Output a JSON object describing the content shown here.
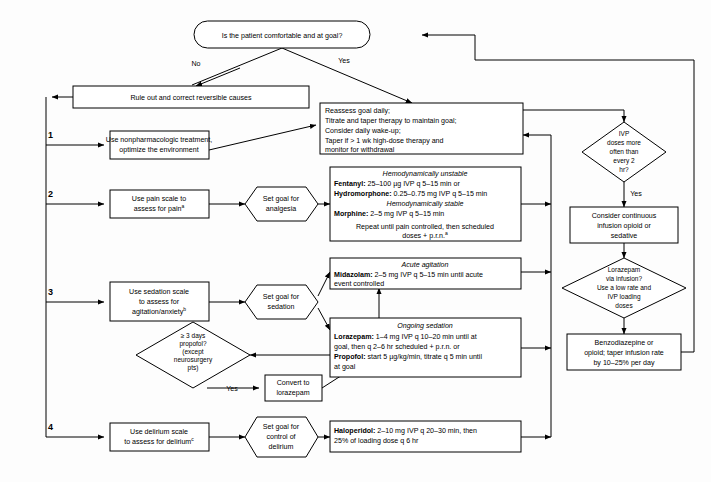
{
  "diagram": {
    "colors": {
      "line": "#000000",
      "box_fill": "#ffffff",
      "page_bg": "#fdfdfd"
    }
  },
  "nodes": {
    "start": {
      "text": "Is the patient comfortable and at goal?",
      "shape": "rounded"
    },
    "rule_out": {
      "text": "Rule out and correct reversible causes",
      "shape": "rect"
    },
    "reassess": {
      "shape": "rect",
      "lines": [
        "Reassess goal daily;",
        "Titrate and taper therapy to maintain goal;",
        "Consider daily wake-up;",
        "Taper if > 1 wk high-dose therapy and",
        "monitor for withdrawal"
      ]
    },
    "step1": {
      "number": "1",
      "shape": "rect",
      "lines": [
        "Use nonpharmacologic treatment,",
        "optimize the environment"
      ]
    },
    "step2": {
      "number": "2",
      "shape": "rect",
      "lines": [
        "Use pain scale to",
        "assess for pain"
      ],
      "superscript": "a"
    },
    "goal_analgesia": {
      "shape": "hexagon",
      "lines": [
        "Set goal for",
        "analgesia"
      ]
    },
    "analgesia_box": {
      "shape": "rect",
      "rows": [
        {
          "style": "italic-center",
          "text": "Hemodynamically unstable"
        },
        {
          "style": "mixed",
          "bold": "Fentanyl:",
          "rest": " 25–100 µg IVP q 5–15 min or"
        },
        {
          "style": "mixed",
          "bold": "Hydromorphone:",
          "rest": " 0.25–0.75 mg IVP q 5–15 min"
        },
        {
          "style": "italic-center",
          "text": "Hemodynamically stable"
        },
        {
          "style": "mixed",
          "bold": "Morphine:",
          "rest": " 2–5 mg IVP q 5–15 min"
        },
        {
          "style": "blank",
          "text": ""
        },
        {
          "style": "center",
          "text": "Repeat until pain controlled, then scheduled"
        },
        {
          "style": "center",
          "text": "doses + p.r.n.",
          "superscript": "a"
        }
      ]
    },
    "step3": {
      "number": "3",
      "shape": "rect",
      "lines": [
        "Use sedation scale",
        "to assess for",
        "agitation/anxiety"
      ],
      "superscript": "b"
    },
    "goal_sedation": {
      "shape": "hexagon",
      "lines": [
        "Set goal for",
        "sedation"
      ]
    },
    "acute_agitation": {
      "shape": "rect",
      "rows": [
        {
          "style": "italic-center",
          "text": "Acute agitation"
        },
        {
          "style": "mixed",
          "bold": "Midazolam:",
          "rest": " 2–5 mg IVP q 5–15 min until acute"
        },
        {
          "style": "plain",
          "text": "event controlled"
        }
      ]
    },
    "ongoing_sedation": {
      "shape": "rect",
      "rows": [
        {
          "style": "italic-center",
          "text": "Ongoing sedation"
        },
        {
          "style": "mixed",
          "bold": "Lorazepam:",
          "rest": " 1–4 mg IVP q 10–20 min until at"
        },
        {
          "style": "plain",
          "text": "goal, then q 2–6 hr scheduled + p.r.n. or"
        },
        {
          "style": "mixed",
          "bold": "Propofol:",
          "rest": " start 5 µg/kg/min, titrate q 5 min until"
        },
        {
          "style": "plain",
          "text": "at goal"
        }
      ]
    },
    "propofol_decision": {
      "shape": "diamond",
      "lines": [
        "≥ 3 days",
        "propofol?",
        "(except",
        "neurosurgery",
        "pts)"
      ]
    },
    "convert": {
      "shape": "rect",
      "lines": [
        "Convert to",
        "lorazepam"
      ]
    },
    "step4": {
      "number": "4",
      "shape": "rect",
      "lines": [
        "Use delirium scale",
        "to assess for delirium"
      ],
      "superscript": "c"
    },
    "goal_delirium": {
      "shape": "hexagon",
      "lines": [
        "Set goal for",
        "control of",
        "delirium"
      ]
    },
    "delirium_box": {
      "shape": "rect",
      "rows": [
        {
          "style": "mixed",
          "bold": "Haloperidol:",
          "rest": " 2–10 mg IVP q 20–30 min, then"
        },
        {
          "style": "plain",
          "text": "25% of loading dose q 6 hr"
        }
      ]
    },
    "ivp_decision": {
      "shape": "diamond",
      "lines": [
        "IVP",
        "doses more",
        "often than",
        "every 2",
        "hr?"
      ]
    },
    "consider_infusion": {
      "shape": "rect",
      "lines": [
        "Consider continuous",
        "infusion opioid or",
        "sedative"
      ]
    },
    "lorazepam_decision": {
      "shape": "diamond",
      "lines": [
        "Lorazepam",
        "via infusion?",
        "Use a low rate and",
        "IVP loading",
        "doses"
      ]
    },
    "taper_box": {
      "shape": "rect",
      "lines": [
        "Benzodiazepine or",
        "opioid; taper infusion rate",
        "by 10–25% per day"
      ]
    }
  },
  "edge_labels": {
    "no": "No",
    "yes_top": "Yes",
    "yes_ivp": "Yes",
    "yes_propofol": "Yes"
  }
}
